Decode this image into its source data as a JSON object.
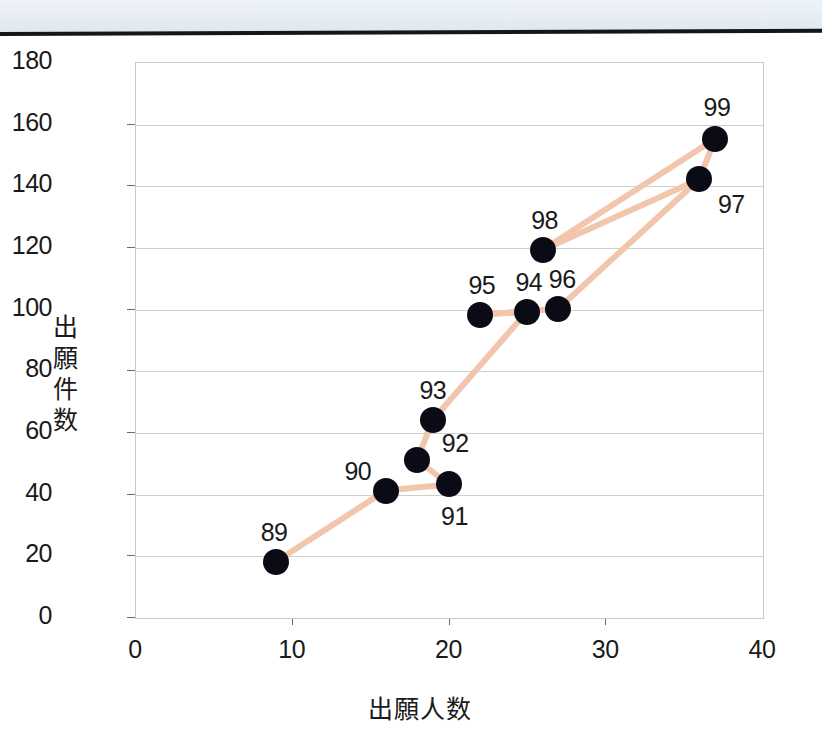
{
  "page": {
    "scan_band": true,
    "background": "#ffffff"
  },
  "chart_data": {
    "type": "scatter",
    "title": "",
    "xlabel": "出願人数",
    "ylabel": "出願件数",
    "xlim": [
      0,
      40
    ],
    "ylim": [
      0,
      180
    ],
    "xticks": [
      "0",
      "10",
      "20",
      "30",
      "40"
    ],
    "xtick_values": [
      0,
      10,
      20,
      30,
      40
    ],
    "yticks": [
      "0",
      "20",
      "40",
      "60",
      "80",
      "100",
      "120",
      "140",
      "160",
      "180"
    ],
    "ytick_values": [
      0,
      20,
      40,
      60,
      80,
      100,
      120,
      140,
      160,
      180
    ],
    "grid": true,
    "legend": false,
    "marker_color": "#0b0b16",
    "line_color": "#f2c6ad",
    "points": [
      {
        "label": "89",
        "x": 9,
        "y": 18,
        "label_dx": -2,
        "label_dy": -30
      },
      {
        "label": "90",
        "x": 16,
        "y": 41,
        "label_dx": -28,
        "label_dy": -20
      },
      {
        "label": "91",
        "x": 20,
        "y": 43,
        "label_dx": 6,
        "label_dy": 32
      },
      {
        "label": "92",
        "x": 18,
        "y": 51,
        "label_dx": 38,
        "label_dy": -17
      },
      {
        "label": "93",
        "x": 19,
        "y": 64,
        "label_dx": 0,
        "label_dy": -30
      },
      {
        "label": "94",
        "x": 25,
        "y": 99,
        "label_dx": 2,
        "label_dy": -30
      },
      {
        "label": "95",
        "x": 22,
        "y": 98,
        "label_dx": 2,
        "label_dy": -30
      },
      {
        "label": "96",
        "x": 27,
        "y": 100,
        "label_dx": 4,
        "label_dy": -30
      },
      {
        "label": "97",
        "x": 36,
        "y": 142,
        "label_dx": 32,
        "label_dy": 25
      },
      {
        "label": "98",
        "x": 26,
        "y": 119,
        "label_dx": 2,
        "label_dy": -30
      },
      {
        "label": "99",
        "x": 37,
        "y": 155,
        "label_dx": 2,
        "label_dy": -32
      }
    ],
    "connections": [
      [
        "89",
        "90"
      ],
      [
        "90",
        "91"
      ],
      [
        "91",
        "92"
      ],
      [
        "92",
        "93"
      ],
      [
        "93",
        "94"
      ],
      [
        "94",
        "95"
      ],
      [
        "95",
        "96"
      ],
      [
        "96",
        "97"
      ],
      [
        "97",
        "98"
      ],
      [
        "98",
        "99"
      ],
      [
        "97",
        "99"
      ]
    ]
  }
}
